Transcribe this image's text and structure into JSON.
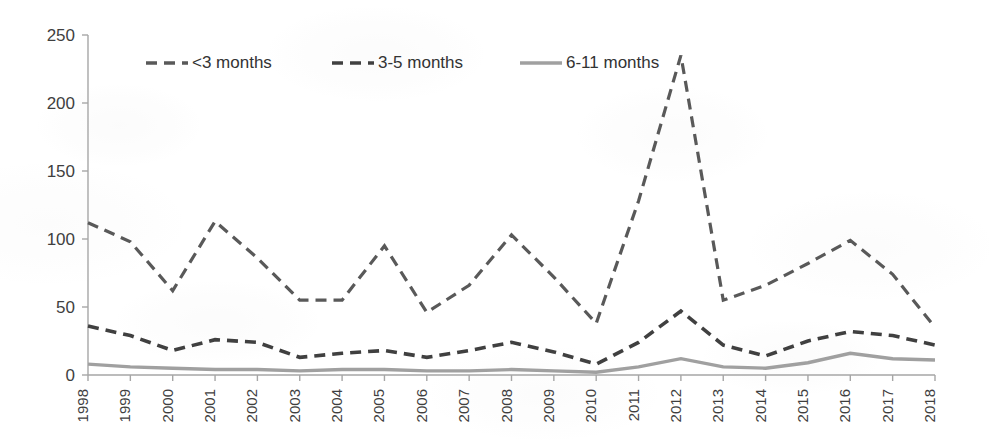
{
  "chart_data": {
    "type": "line",
    "title": "",
    "subtitle": "",
    "xlabel": "",
    "ylabel": "",
    "xlim": [
      1998,
      2018
    ],
    "ylim": [
      0,
      250
    ],
    "ytick_values": [
      0,
      50,
      100,
      150,
      200,
      250
    ],
    "ytick_labels": [
      "0",
      "50",
      "100",
      "150",
      "200",
      "250"
    ],
    "grid": false,
    "legend_position": "top-center",
    "categories": [
      "1998",
      "1999",
      "2000",
      "2001",
      "2002",
      "2003",
      "2004",
      "2005",
      "2006",
      "2007",
      "2008",
      "2009",
      "2010",
      "2011",
      "2012",
      "2013",
      "2014",
      "2015",
      "2016",
      "2017",
      "2018"
    ],
    "series": [
      {
        "name": "<3 months",
        "style": "dashed",
        "color": "#595959",
        "values": [
          112,
          98,
          62,
          113,
          86,
          55,
          55,
          95,
          46,
          66,
          103,
          72,
          38,
          128,
          235,
          55,
          66,
          82,
          99,
          74,
          35
        ]
      },
      {
        "name": "3-5 months",
        "style": "dashed",
        "color": "#404040",
        "values": [
          36,
          29,
          18,
          26,
          24,
          13,
          16,
          18,
          13,
          18,
          24,
          17,
          8,
          24,
          47,
          22,
          14,
          25,
          32,
          29,
          22
        ]
      },
      {
        "name": "6-11 months",
        "style": "solid",
        "color": "#a0a0a0",
        "values": [
          8,
          6,
          5,
          4,
          4,
          3,
          4,
          4,
          3,
          3,
          4,
          3,
          2,
          6,
          12,
          6,
          5,
          9,
          16,
          12,
          11
        ]
      }
    ]
  },
  "legend": {
    "entries": [
      {
        "label": "<3 months",
        "style": "dashed",
        "color": "#595959"
      },
      {
        "label": "3-5 months",
        "style": "dashed",
        "color": "#404040"
      },
      {
        "label": "6-11 months",
        "style": "solid",
        "color": "#a0a0a0"
      }
    ]
  }
}
